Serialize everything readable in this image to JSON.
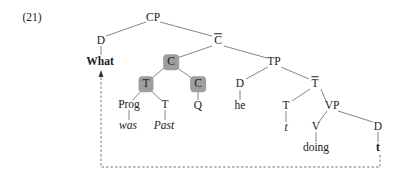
{
  "example_number": "(21)",
  "nodes": {
    "cp": "CP",
    "d_spec": "D",
    "what": "What",
    "cbar": "C",
    "c_head": "C",
    "t_moved": "T",
    "c_q": "C",
    "tp": "TP",
    "d_subj": "D",
    "he": "he",
    "tbar": "T",
    "prog": "Prog",
    "was": "was",
    "t_past": "T",
    "past": "Past",
    "q": "Q",
    "t_trace_node": "T",
    "t_trace": "t",
    "vp": "VP",
    "v": "V",
    "doing": "doing",
    "d_obj": "D",
    "d_trace": "t"
  },
  "colors": {
    "line": "#555555",
    "shade": "#9e9e9e",
    "text": "#1a1a1a"
  }
}
